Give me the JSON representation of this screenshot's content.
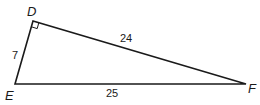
{
  "diagram": {
    "type": "right-triangle",
    "vertices": {
      "D": {
        "label": "D",
        "x": 33,
        "y": 21
      },
      "E": {
        "label": "E",
        "x": 15,
        "y": 84
      },
      "F": {
        "label": "F",
        "x": 246,
        "y": 84
      }
    },
    "right_angle_at": "D",
    "sides": {
      "DE": {
        "label": "7"
      },
      "DF": {
        "label": "24"
      },
      "EF": {
        "label": "25"
      }
    },
    "stroke_color": "#1a1a1a"
  }
}
